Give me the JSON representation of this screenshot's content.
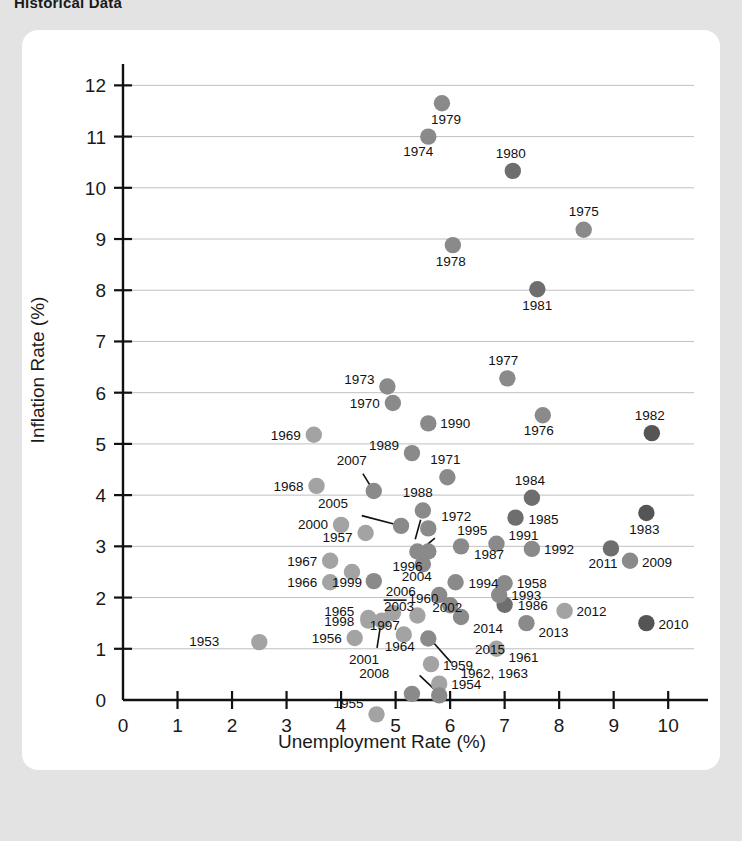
{
  "page": {
    "title": "Historical Data",
    "background_color": "#e3e3e3",
    "card_color": "#ffffff"
  },
  "chart_data": {
    "type": "scatter",
    "title": "Historical Data",
    "xlabel": "Unemployment Rate (%)",
    "ylabel": "Inflation Rate (%)",
    "xlim": [
      0,
      10.4
    ],
    "ylim": [
      0,
      12.3
    ],
    "xticks": [
      0,
      1,
      2,
      3,
      4,
      5,
      6,
      7,
      8,
      9,
      10
    ],
    "yticks": [
      0,
      1,
      2,
      3,
      4,
      5,
      6,
      7,
      8,
      9,
      10,
      11,
      12
    ],
    "grid": "horizontal",
    "legend": "none",
    "marker_colors": {
      "light": "#a3a3a3",
      "mid": "#8a8a8a",
      "dark": "#6e6e6e",
      "darkest": "#555555"
    },
    "points": [
      {
        "label": "1953",
        "x": 2.5,
        "y": 1.13,
        "color": "#a3a3a3",
        "lx": -40,
        "ly": 4,
        "anchor": "end"
      },
      {
        "label": "1954",
        "x": 5.8,
        "y": 0.32,
        "color": "#a3a3a3",
        "lx": 12,
        "ly": 5,
        "anchor": "start"
      },
      {
        "label": "1955",
        "x": 4.65,
        "y": -0.28,
        "color": "#a3a3a3",
        "lx": -13,
        "ly": -6,
        "anchor": "end"
      },
      {
        "label": "1956",
        "x": 4.25,
        "y": 1.21,
        "color": "#a3a3a3",
        "lx": -13,
        "ly": 5,
        "anchor": "end"
      },
      {
        "label": "1957",
        "x": 4.45,
        "y": 3.26,
        "color": "#a3a3a3",
        "lx": -13,
        "ly": 9,
        "anchor": "end"
      },
      {
        "label": "1958",
        "x": 7.0,
        "y": 2.28,
        "color": "#8a8a8a",
        "lx": 12,
        "ly": 5,
        "anchor": "start"
      },
      {
        "label": "1959",
        "x": 5.65,
        "y": 0.7,
        "color": "#a3a3a3",
        "lx": 12,
        "ly": 6,
        "anchor": "start"
      },
      {
        "label": "1960",
        "x": 5.4,
        "y": 1.65,
        "color": "#a3a3a3",
        "lx": 6,
        "ly": -12,
        "anchor": "middle"
      },
      {
        "label": "1961",
        "x": 6.85,
        "y": 1.0,
        "color": "#a3a3a3",
        "lx": 12,
        "ly": 13,
        "anchor": "start"
      },
      {
        "label": "1962, 1963",
        "x": 5.6,
        "y": 1.2,
        "color": "#8a8a8a",
        "lx": 66,
        "ly": 39,
        "anchor": "middle"
      },
      {
        "label": "1964",
        "x": 5.15,
        "y": 1.28,
        "color": "#a3a3a3",
        "lx": -4,
        "ly": 17,
        "anchor": "middle"
      },
      {
        "label": "1965",
        "x": 4.5,
        "y": 1.6,
        "color": "#a3a3a3",
        "lx": -14,
        "ly": -2,
        "anchor": "end"
      },
      {
        "label": "1966",
        "x": 3.8,
        "y": 2.3,
        "color": "#a3a3a3",
        "lx": -13,
        "ly": 5,
        "anchor": "end"
      },
      {
        "label": "1967",
        "x": 3.8,
        "y": 2.72,
        "color": "#a3a3a3",
        "lx": -13,
        "ly": 5,
        "anchor": "end"
      },
      {
        "label": "1968",
        "x": 3.55,
        "y": 4.18,
        "color": "#a3a3a3",
        "lx": -13,
        "ly": 5,
        "anchor": "end"
      },
      {
        "label": "1969",
        "x": 3.5,
        "y": 5.18,
        "color": "#a3a3a3",
        "lx": -13,
        "ly": 5,
        "anchor": "end"
      },
      {
        "label": "1970",
        "x": 4.95,
        "y": 5.8,
        "color": "#8a8a8a",
        "lx": -13,
        "ly": 5,
        "anchor": "end"
      },
      {
        "label": "1971",
        "x": 5.95,
        "y": 4.35,
        "color": "#8a8a8a",
        "lx": -2,
        "ly": -13,
        "anchor": "middle"
      },
      {
        "label": "1972",
        "x": 5.6,
        "y": 3.35,
        "color": "#8a8a8a",
        "lx": 13,
        "ly": -7,
        "anchor": "start"
      },
      {
        "label": "1973",
        "x": 4.85,
        "y": 6.12,
        "color": "#8a8a8a",
        "lx": -13,
        "ly": -3,
        "anchor": "end"
      },
      {
        "label": "1974",
        "x": 5.6,
        "y": 11.0,
        "color": "#8a8a8a",
        "lx": -10,
        "ly": 19,
        "anchor": "middle"
      },
      {
        "label": "1975",
        "x": 8.45,
        "y": 9.18,
        "color": "#8a8a8a",
        "lx": 0,
        "ly": -14,
        "anchor": "middle"
      },
      {
        "label": "1976",
        "x": 7.7,
        "y": 5.56,
        "color": "#8a8a8a",
        "lx": -4,
        "ly": 20,
        "anchor": "middle"
      },
      {
        "label": "1977",
        "x": 7.05,
        "y": 6.28,
        "color": "#8a8a8a",
        "lx": -4,
        "ly": -13,
        "anchor": "middle"
      },
      {
        "label": "1978",
        "x": 6.05,
        "y": 8.88,
        "color": "#8a8a8a",
        "lx": -2,
        "ly": 21,
        "anchor": "middle"
      },
      {
        "label": "1979",
        "x": 5.85,
        "y": 11.65,
        "color": "#8a8a8a",
        "lx": 4,
        "ly": 21,
        "anchor": "middle"
      },
      {
        "label": "1980",
        "x": 7.15,
        "y": 10.33,
        "color": "#6e6e6e",
        "lx": -2,
        "ly": -13,
        "anchor": "middle"
      },
      {
        "label": "1981",
        "x": 7.6,
        "y": 8.02,
        "color": "#6e6e6e",
        "lx": 0,
        "ly": 21,
        "anchor": "middle"
      },
      {
        "label": "1982",
        "x": 9.7,
        "y": 5.21,
        "color": "#555555",
        "lx": -2,
        "ly": -13,
        "anchor": "middle"
      },
      {
        "label": "1983",
        "x": 9.6,
        "y": 3.65,
        "color": "#555555",
        "lx": -2,
        "ly": 21,
        "anchor": "middle"
      },
      {
        "label": "1984",
        "x": 7.5,
        "y": 3.95,
        "color": "#6e6e6e",
        "lx": -2,
        "ly": -13,
        "anchor": "middle"
      },
      {
        "label": "1985",
        "x": 7.2,
        "y": 3.56,
        "color": "#6e6e6e",
        "lx": 13,
        "ly": 6,
        "anchor": "start"
      },
      {
        "label": "1986",
        "x": 7.0,
        "y": 1.86,
        "color": "#6e6e6e",
        "lx": 13,
        "ly": 5,
        "anchor": "start"
      },
      {
        "label": "1987",
        "x": 6.2,
        "y": 3.0,
        "color": "#8a8a8a",
        "lx": 13,
        "ly": 13,
        "anchor": "start"
      },
      {
        "label": "1988",
        "x": 5.5,
        "y": 3.7,
        "color": "#8a8a8a",
        "lx": -5,
        "ly": -13,
        "anchor": "middle"
      },
      {
        "label": "1989",
        "x": 5.3,
        "y": 4.82,
        "color": "#8a8a8a",
        "lx": -13,
        "ly": -3,
        "anchor": "end"
      },
      {
        "label": "1990",
        "x": 5.6,
        "y": 5.4,
        "color": "#8a8a8a",
        "lx": 12,
        "ly": 5,
        "anchor": "start"
      },
      {
        "label": "1991",
        "x": 6.85,
        "y": 3.05,
        "color": "#8a8a8a",
        "lx": 12,
        "ly": -4,
        "anchor": "start"
      },
      {
        "label": "1992",
        "x": 7.5,
        "y": 2.95,
        "color": "#8a8a8a",
        "lx": 12,
        "ly": 5,
        "anchor": "start"
      },
      {
        "label": "1993",
        "x": 6.9,
        "y": 2.05,
        "color": "#8a8a8a",
        "lx": 12,
        "ly": 5,
        "anchor": "start"
      },
      {
        "label": "1994",
        "x": 6.1,
        "y": 2.3,
        "color": "#8a8a8a",
        "lx": 13,
        "ly": 6,
        "anchor": "start"
      },
      {
        "label": "1995",
        "x": 5.6,
        "y": 2.9,
        "color": "#8a8a8a",
        "lx": 29,
        "ly": -16,
        "anchor": "start"
      },
      {
        "label": "1996",
        "x": 5.4,
        "y": 2.9,
        "color": "#8a8a8a",
        "lx": -10,
        "ly": 20,
        "anchor": "middle"
      },
      {
        "label": "1997",
        "x": 4.95,
        "y": 1.7,
        "color": "#a3a3a3",
        "lx": -8,
        "ly": 17,
        "anchor": "middle"
      },
      {
        "label": "1998",
        "x": 4.5,
        "y": 1.55,
        "color": "#a3a3a3",
        "lx": -14,
        "ly": 5,
        "anchor": "end"
      },
      {
        "label": "1999",
        "x": 4.2,
        "y": 2.5,
        "color": "#a3a3a3",
        "lx": -5,
        "ly": 15,
        "anchor": "middle"
      },
      {
        "label": "2000",
        "x": 4.0,
        "y": 3.42,
        "color": "#a3a3a3",
        "lx": -13,
        "ly": 4,
        "anchor": "end"
      },
      {
        "label": "2001",
        "x": 4.75,
        "y": 1.55,
        "color": "#a3a3a3",
        "lx": -18,
        "ly": 43,
        "anchor": "middle"
      },
      {
        "label": "2002",
        "x": 5.8,
        "y": 2.05,
        "color": "#8a8a8a",
        "lx": 8,
        "ly": 17,
        "anchor": "middle"
      },
      {
        "label": "2003",
        "x": 6.0,
        "y": 1.85,
        "color": "#8a8a8a",
        "lx": -36,
        "ly": 6,
        "anchor": "end"
      },
      {
        "label": "2004",
        "x": 5.5,
        "y": 2.65,
        "color": "#8a8a8a",
        "lx": -6,
        "ly": 17,
        "anchor": "middle"
      },
      {
        "label": "2005",
        "x": 5.1,
        "y": 3.4,
        "color": "#8a8a8a",
        "lx": -53,
        "ly": -18,
        "anchor": "end"
      },
      {
        "label": "2006",
        "x": 4.6,
        "y": 2.32,
        "color": "#8a8a8a",
        "lx": 12,
        "ly": 15,
        "anchor": "start"
      },
      {
        "label": "2007",
        "x": 4.6,
        "y": 4.08,
        "color": "#8a8a8a",
        "lx": -22,
        "ly": -26,
        "anchor": "middle"
      },
      {
        "label": "2008",
        "x": 5.8,
        "y": 0.09,
        "color": "#8a8a8a",
        "lx": -50,
        "ly": -17,
        "anchor": "end"
      },
      {
        "label": "2009",
        "x": 9.3,
        "y": 2.72,
        "color": "#8a8a8a",
        "lx": 12,
        "ly": 6,
        "anchor": "start"
      },
      {
        "label": "2010",
        "x": 9.6,
        "y": 1.5,
        "color": "#555555",
        "lx": 12,
        "ly": 6,
        "anchor": "start"
      },
      {
        "label": "2011",
        "x": 8.95,
        "y": 2.96,
        "color": "#6e6e6e",
        "lx": -8,
        "ly": 20,
        "anchor": "middle"
      },
      {
        "label": "2012",
        "x": 8.1,
        "y": 1.74,
        "color": "#a3a3a3",
        "lx": 12,
        "ly": 5,
        "anchor": "start"
      },
      {
        "label": "2013",
        "x": 7.4,
        "y": 1.5,
        "color": "#8a8a8a",
        "lx": 12,
        "ly": 14,
        "anchor": "start"
      },
      {
        "label": "2014",
        "x": 6.2,
        "y": 1.62,
        "color": "#8a8a8a",
        "lx": 12,
        "ly": 16,
        "anchor": "start"
      },
      {
        "label": "2015",
        "x": 5.3,
        "y": 0.12,
        "color": "#8a8a8a",
        "lx": 78,
        "ly": -40,
        "anchor": "middle"
      }
    ],
    "leaders": [
      {
        "from_label": "2005",
        "x1": 4.38,
        "y1": 3.6,
        "x2": 5.02,
        "y2": 3.42
      },
      {
        "from_label": "2007",
        "x1": 4.4,
        "y1": 4.42,
        "x2": 4.56,
        "y2": 4.14
      },
      {
        "from_label": "1996",
        "x1": 5.36,
        "y1": 3.14,
        "x2": 5.46,
        "y2": 3.52
      },
      {
        "from_label": "1995",
        "x1": 5.72,
        "y1": 3.16,
        "x2": 5.52,
        "y2": 2.98
      },
      {
        "from_label": "1965",
        "x1": 4.78,
        "y1": 1.95,
        "x2": 5.2,
        "y2": 1.95
      },
      {
        "from_label": "2001",
        "x1": 4.66,
        "y1": 1.02,
        "x2": 4.73,
        "y2": 1.5
      },
      {
        "from_label": "1962, 1963",
        "x1": 6.02,
        "y1": 0.73,
        "x2": 5.66,
        "y2": 1.16
      },
      {
        "from_label": "2008",
        "x1": 5.44,
        "y1": 0.48,
        "x2": 5.78,
        "y2": 0.14
      }
    ]
  }
}
